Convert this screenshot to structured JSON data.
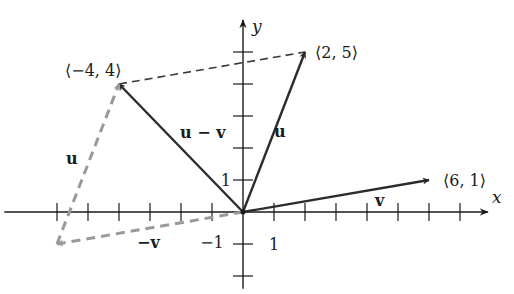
{
  "figure": {
    "axes": {
      "x_label": "x",
      "y_label": "y",
      "x_ticks": [
        -6,
        -5,
        -4,
        -3,
        -2,
        -1,
        1,
        2,
        3,
        4,
        5,
        6,
        7
      ],
      "y_ticks": [
        -2,
        -1,
        1,
        2,
        3,
        4,
        5
      ],
      "x_range": [
        -7.7,
        7.9
      ],
      "y_range": [
        -2.4,
        6.0
      ],
      "tick_labels": [
        {
          "axis": "y",
          "value": 1,
          "text": "1"
        },
        {
          "axis": "x",
          "value": -1,
          "text": "−1"
        },
        {
          "axis": "x",
          "value": 1,
          "text": "1"
        }
      ]
    },
    "vectors": [
      {
        "id": "u",
        "from": [
          0,
          0
        ],
        "to": [
          2,
          5
        ],
        "label": "u",
        "style": "solid",
        "color": "#2b2b2b"
      },
      {
        "id": "v",
        "from": [
          0,
          0
        ],
        "to": [
          6,
          1
        ],
        "label": "v",
        "style": "solid",
        "color": "#2b2b2b"
      },
      {
        "id": "u-minus-v",
        "from": [
          0,
          0
        ],
        "to": [
          -4,
          4
        ],
        "label": "u − v",
        "style": "solid",
        "color": "#2b2b2b"
      },
      {
        "id": "neg-v",
        "from": [
          0,
          0
        ],
        "to": [
          -6,
          -1
        ],
        "label": "−v",
        "style": "dashed",
        "color": "#999999"
      },
      {
        "id": "u-translated",
        "from": [
          -6,
          -1
        ],
        "to": [
          -4,
          4
        ],
        "label": "u",
        "style": "dashed",
        "color": "#999999"
      }
    ],
    "connector": {
      "from": [
        -4,
        4
      ],
      "to": [
        2,
        5
      ],
      "style": "dashed",
      "color": "#3a3a3a"
    },
    "point_labels": [
      {
        "at": [
          2,
          5
        ],
        "text": "⟨2, 5⟩"
      },
      {
        "at": [
          -4,
          4
        ],
        "text": "⟨−4, 4⟩"
      },
      {
        "at": [
          6,
          1
        ],
        "text": "⟨6, 1⟩"
      }
    ]
  }
}
